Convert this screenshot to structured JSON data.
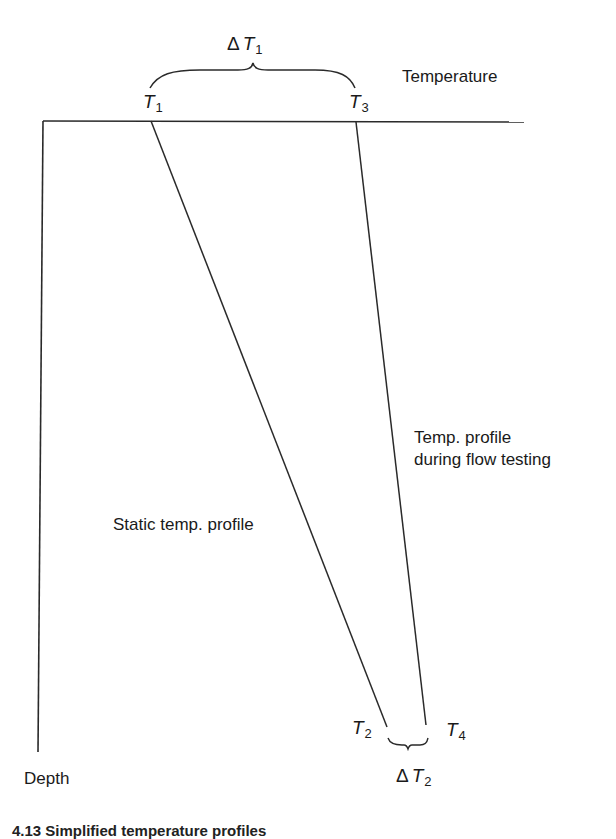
{
  "diagram": {
    "axes": {
      "x_label": "Temperature",
      "y_label": "Depth"
    },
    "lines": {
      "static_profile": {
        "label": "Static temp. profile",
        "top": "T1",
        "bottom": "T2"
      },
      "flow_profile": {
        "label_line1": "Temp. profile",
        "label_line2": "during flow testing",
        "top": "T3",
        "bottom": "T4"
      }
    },
    "points": {
      "t1": {
        "base": "T",
        "sub": "1"
      },
      "t2": {
        "base": "T",
        "sub": "2"
      },
      "t3": {
        "base": "T",
        "sub": "3"
      },
      "t4": {
        "base": "T",
        "sub": "4"
      }
    },
    "differences": {
      "delta_t1": {
        "delta": "Δ",
        "base": "T",
        "sub": "1"
      },
      "delta_t2": {
        "delta": "Δ",
        "base": "T",
        "sub": "2"
      }
    },
    "caption": "4.13  Simplified temperature profiles"
  },
  "colors": {
    "line": "#2a2a2a",
    "text": "#1a1a1a",
    "background": "#ffffff"
  }
}
